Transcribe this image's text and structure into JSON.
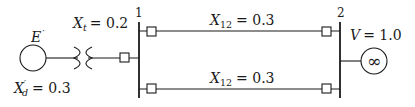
{
  "diagram": {
    "type": "single-line power system diagram",
    "generator": {
      "emf_label": "E",
      "emf_prime": "′",
      "reactance_symbol": "X",
      "reactance_sub": "d",
      "reactance_prime": "′",
      "reactance_value": "= 0.3"
    },
    "transformer": {
      "reactance_symbol": "X",
      "reactance_sub": "t",
      "reactance_value": "= 0.2"
    },
    "buses": [
      {
        "id": "1",
        "label": "1"
      },
      {
        "id": "2",
        "label": "2"
      }
    ],
    "lines": [
      {
        "symbol": "X",
        "sub": "12",
        "value": "= 0.3"
      },
      {
        "symbol": "X",
        "sub": "12",
        "value": "= 0.3"
      }
    ],
    "infinite_bus": {
      "voltage_symbol": "V",
      "voltage_value": "= 1.0",
      "glyph": "∞"
    }
  }
}
